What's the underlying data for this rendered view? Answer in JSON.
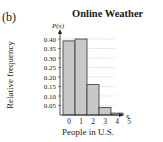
{
  "figure_label": "(b)",
  "chart_data": {
    "type": "bar",
    "title": "Online Weather",
    "xlabel": "People in U.S.",
    "ylabel": "Relative frequency",
    "y_axis_symbol": "P(x)",
    "x_axis_symbol": "x",
    "categories": [
      "0",
      "1",
      "2",
      "3",
      "4",
      "5"
    ],
    "values": [
      0.39,
      0.4,
      0.16,
      0.04,
      0.01,
      0.0
    ],
    "yticks": [
      "0.05",
      "0.10",
      "0.15",
      "0.20",
      "0.25",
      "0.30",
      "0.35",
      "0.40"
    ],
    "ylim": [
      0,
      0.42
    ],
    "grid": true,
    "legend": "none",
    "bar_color": "#c8c8c8",
    "bar_edge_color": "#333333"
  }
}
